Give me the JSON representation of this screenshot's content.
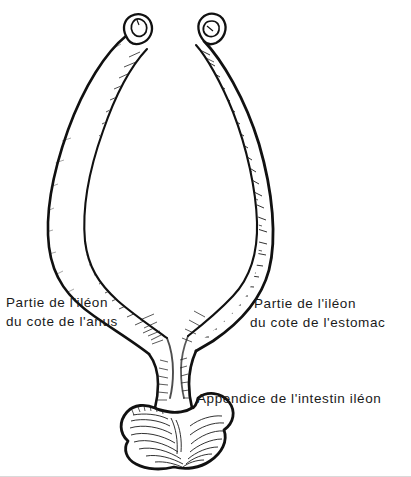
{
  "figure": {
    "kind": "anatomical-line-drawing",
    "background_color": "#ffffff",
    "ink_color": "#111111",
    "text_color": "#1a1a1a",
    "width": 411,
    "height": 477
  },
  "labels": {
    "left": {
      "line1": "Partie de l'iléon",
      "line2": "du cote de l'anus"
    },
    "right": {
      "line1": "Partie  de  l'iléon",
      "line2": "du  cote de l'estomac"
    },
    "bottom": {
      "line1": "Appendice  de  l'intestin  iléon"
    }
  },
  "parts": [
    {
      "name": "left-ileum-limb",
      "description": "slender curved tube running from upper left down to the central junction"
    },
    {
      "name": "right-ileum-limb",
      "description": "thicker curved tube running from upper right down to the central junction"
    },
    {
      "name": "left-cut-end",
      "description": "small ring-shaped cut opening at the top of the left limb"
    },
    {
      "name": "right-cut-end",
      "description": "small ring-shaped cut opening at the top of the right limb"
    },
    {
      "name": "y-junction",
      "description": "confluence where both limbs meet above the appendix neck"
    },
    {
      "name": "appendix-neck",
      "description": "short narrow stalk below the junction"
    },
    {
      "name": "appendix-bulb",
      "description": "lobed cloverleaf-shaped terminal swelling of the appendix"
    }
  ]
}
